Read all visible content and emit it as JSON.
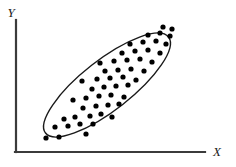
{
  "figure": {
    "title": "",
    "axes": {
      "x_label": "X",
      "y_label": "Y",
      "x_axis_color": "#3b3b3b",
      "y_axis_color": "#3b3b3b",
      "origin": [
        16,
        152
      ],
      "x_axis_end": [
        205,
        152
      ],
      "y_axis_top": [
        16,
        20
      ]
    },
    "ellipse": {
      "stroke_color": "#1a1a1a",
      "fill": "none",
      "center": [
        107,
        85
      ],
      "radius_major": 78,
      "radius_minor": 25,
      "rotation_deg": -38
    },
    "dot_color": "#000000",
    "dot_radius": 2.6
  },
  "chart_data": {
    "type": "scatter",
    "title": "",
    "xlabel": "X",
    "ylabel": "Y",
    "grid": false,
    "legend": null,
    "xlim": [
      0,
      236
    ],
    "ylim": [
      0,
      167
    ],
    "annotations": [
      {
        "kind": "ellipse",
        "label": "correlation envelope",
        "note": "positive linear association"
      }
    ],
    "points": [
      [
        46,
        138
      ],
      [
        59,
        137
      ],
      [
        86,
        134
      ],
      [
        55,
        127
      ],
      [
        68,
        126
      ],
      [
        80,
        124
      ],
      [
        93,
        124
      ],
      [
        64,
        119
      ],
      [
        75,
        117
      ],
      [
        90,
        116
      ],
      [
        101,
        114
      ],
      [
        112,
        117
      ],
      [
        83,
        108
      ],
      [
        96,
        106
      ],
      [
        108,
        105
      ],
      [
        119,
        104
      ],
      [
        73,
        100
      ],
      [
        86,
        98
      ],
      [
        99,
        96
      ],
      [
        111,
        95
      ],
      [
        124,
        97
      ],
      [
        92,
        89
      ],
      [
        104,
        87
      ],
      [
        116,
        86
      ],
      [
        128,
        85
      ],
      [
        82,
        81
      ],
      [
        97,
        79
      ],
      [
        110,
        78
      ],
      [
        123,
        77
      ],
      [
        136,
        80
      ],
      [
        105,
        71
      ],
      [
        118,
        70
      ],
      [
        131,
        69
      ],
      [
        144,
        71
      ],
      [
        100,
        63
      ],
      [
        114,
        61
      ],
      [
        127,
        60
      ],
      [
        140,
        59
      ],
      [
        152,
        62
      ],
      [
        122,
        53
      ],
      [
        135,
        51
      ],
      [
        148,
        50
      ],
      [
        160,
        53
      ],
      [
        130,
        44
      ],
      [
        143,
        42
      ],
      [
        156,
        41
      ],
      [
        166,
        44
      ],
      [
        148,
        35
      ],
      [
        160,
        33
      ],
      [
        170,
        36
      ],
      [
        163,
        27
      ],
      [
        172,
        29
      ]
    ]
  }
}
